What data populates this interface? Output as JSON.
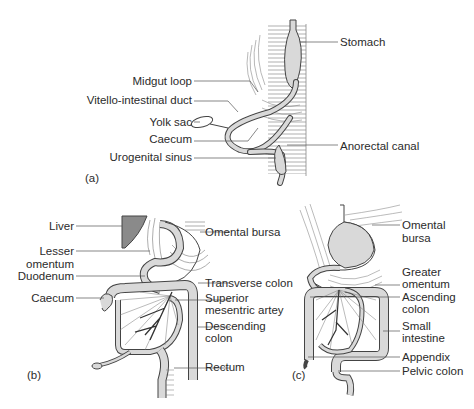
{
  "figure": {
    "panels": [
      {
        "id": "a",
        "caption": "(a)",
        "labels": {
          "stomach": "Stomach",
          "midgut_loop": "Midgut loop",
          "vitello_intestinal_duct": "Vitello-intestinal duct",
          "yolk_sac": "Yolk sac",
          "caecum": "Caecum",
          "urogenital_sinus": "Urogenital sinus",
          "anorectal_canal": "Anorectal canal"
        }
      },
      {
        "id": "b",
        "caption": "(b)",
        "labels": {
          "liver": "Liver",
          "lesser_omentum_1": "Lesser",
          "lesser_omentum_2": "omentum",
          "duodenum": "Duodenum",
          "caecum": "Caecum",
          "omental_bursa": "Omental bursa",
          "transverse_colon": "Transverse colon",
          "superior_mesentric_artery_1": "Superior",
          "superior_mesentric_artery_2": "mesentric artey",
          "descending_colon_1": "Descending",
          "descending_colon_2": "colon",
          "rectum": "Rectum"
        }
      },
      {
        "id": "c",
        "caption": "(c)",
        "labels": {
          "omental_bursa_1": "Omental",
          "omental_bursa_2": "bursa",
          "greater_omentum_1": "Greater",
          "greater_omentum_2": "omentum",
          "ascending_colon_1": "Ascending",
          "ascending_colon_2": "colon",
          "small_intestine_1": "Small",
          "small_intestine_2": "intestine",
          "appendix": "Appendix",
          "pelvic_colon": "Pelvic colon"
        }
      }
    ],
    "colors": {
      "gut_fill": "#d9d9d9",
      "liver_fill": "#8a8a8a",
      "line": "#444444"
    }
  }
}
